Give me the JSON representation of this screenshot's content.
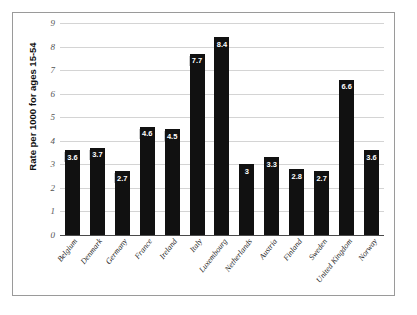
{
  "chart_data": {
    "type": "bar",
    "title": "",
    "xlabel": "",
    "ylabel": "Rate per 1000 for ages 15-54",
    "ylim": [
      0,
      9
    ],
    "yticks": [
      "0",
      "1",
      "2",
      "3",
      "4",
      "5",
      "6",
      "7",
      "8",
      "9"
    ],
    "grid": true,
    "legend": false,
    "categories": [
      "Belgium",
      "Denmark",
      "Germany",
      "France",
      "Ireland",
      "Italy",
      "Luxembourg",
      "Netherlands",
      "Austria",
      "Finland",
      "Sweden",
      "United Kingdom",
      "Norway"
    ],
    "values": [
      3.6,
      3.7,
      2.7,
      4.6,
      4.5,
      7.7,
      8.4,
      3.0,
      3.3,
      2.8,
      2.7,
      6.6,
      3.6
    ],
    "value_labels": [
      "3.6",
      "3.7",
      "2.7",
      "4.6",
      "4.5",
      "7.7",
      "8.4",
      "3",
      "3.3",
      "2.8",
      "2.7",
      "6.6",
      "3.6"
    ],
    "bar_color": "#111111",
    "label_text_color": "#ffffff",
    "gridline_color": "#d4d4d4",
    "axis_color": "#4a4a4a",
    "frame_color": "#9a9a9a",
    "background": "#ffffff"
  }
}
